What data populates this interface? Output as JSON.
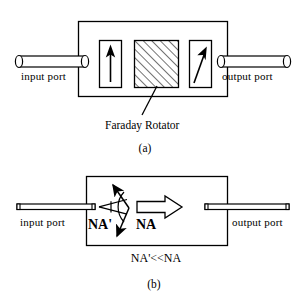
{
  "figure": {
    "background_color": "#ffffff",
    "line_color": "#000000",
    "panels": [
      {
        "id": "a",
        "caption": "(a)",
        "input_label": "input port",
        "output_label": "output port",
        "annotation_label": "Faraday Rotator",
        "components": [
          {
            "name": "input-polarizer",
            "arrow": "vertical-up-arrow",
            "angle_deg": 0
          },
          {
            "name": "faraday-rotator",
            "fill": "diagonal-hatch"
          },
          {
            "name": "output-polarizer",
            "arrow": "diagonal-up-right-arrow",
            "angle_deg": 45
          }
        ]
      },
      {
        "id": "b",
        "caption": "(b)",
        "input_label": "input port",
        "output_label": "output port",
        "small_na_label": "NA'",
        "large_na_label": "NA",
        "relation_label": "NA'<<NA",
        "components": [
          {
            "name": "input-fiber-cone",
            "meaning": "small numerical aperture cone"
          },
          {
            "name": "divergence-arrow-up",
            "meaning": "scattered ray upward"
          },
          {
            "name": "divergence-arrow-down",
            "meaning": "scattered ray downward"
          },
          {
            "name": "large-aperture-arrow",
            "meaning": "wide numerical aperture beam"
          }
        ]
      }
    ]
  }
}
